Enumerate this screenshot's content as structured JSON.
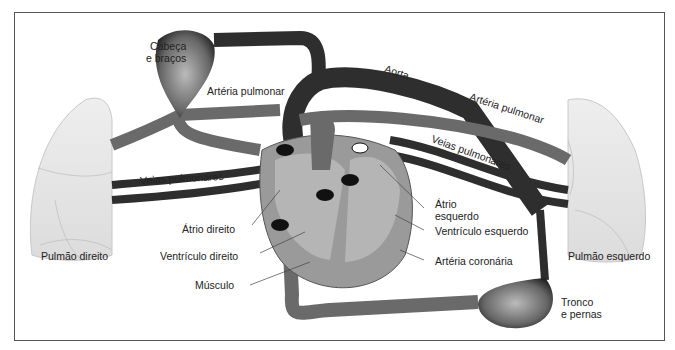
{
  "diagram": {
    "colors": {
      "artery_dark": "#2e2e2e",
      "vein_gray": "#6a6a6a",
      "heart_fill": "#9a9a9a",
      "heart_inner": "#b5b5b5",
      "lung_fill": "#e6e6e6",
      "frame": "#555555"
    },
    "labels": {
      "head_arms": [
        "Cabeça",
        "e braços"
      ],
      "pulmonary_artery_left": "Artéria pulmonar",
      "aorta": "Aorta",
      "pulmonary_artery_right": "Artéria pulmonar",
      "pulmonary_veins_left": "Veias pulmonares",
      "pulmonary_veins_right": "Veias pulmonares",
      "right_lung": "Pulmão direito",
      "left_lung": "Pulmão esquerdo",
      "right_atrium": "Átrio direito",
      "right_ventricle": "Ventrículo direito",
      "muscle": "Músculo",
      "left_atrium": [
        "Átrio",
        "esquerdo"
      ],
      "left_ventricle": "Ventrículo esquerdo",
      "coronary_artery": "Artéria coronária",
      "trunk_legs": [
        "Tronco",
        "e pernas"
      ]
    }
  }
}
